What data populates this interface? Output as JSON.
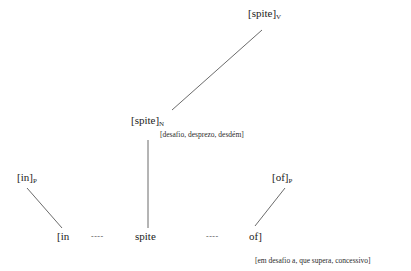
{
  "diagram": {
    "type": "lexical-decomposition-tree",
    "background_color": "#ffffff",
    "line_color": "#5a5a5a",
    "text_color": "#222222",
    "nodes": {
      "root": {
        "label": "[spite]",
        "subscript": "V"
      },
      "mid": {
        "label": "[spite]",
        "subscript": "N",
        "gloss": "[desafio, desprezo, desdém]"
      },
      "left": {
        "label": "[in]",
        "subscript": "P"
      },
      "right": {
        "label": "[of]",
        "subscript": "P"
      }
    },
    "terminals": {
      "first": "[in",
      "second": "spite",
      "third": "of]",
      "connector_left": "----",
      "connector_right": "----"
    },
    "bottom_gloss": "[em desafio a, que supera, concessivo]"
  }
}
